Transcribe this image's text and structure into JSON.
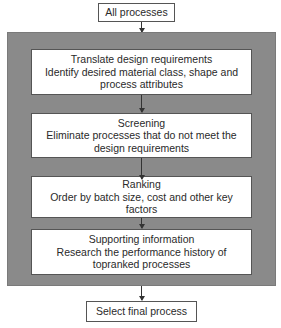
{
  "diagram": {
    "type": "flowchart",
    "start": {
      "label": "All processes"
    },
    "steps": [
      {
        "title": "Translate design requirements",
        "lines": [
          "Identify desired material class, shape and",
          "process attributes"
        ]
      },
      {
        "title": "Screening",
        "lines": [
          "Eliminate processes that do not meet the",
          "design requirements"
        ]
      },
      {
        "title": "Ranking",
        "lines": [
          "Order by batch size, cost and other key",
          "factors"
        ]
      },
      {
        "title": "Supporting information",
        "lines": [
          "Research the performance history of",
          "topranked processes"
        ]
      }
    ],
    "end": {
      "label": "Select final process"
    },
    "colors": {
      "shade_background": "#cfcfcf",
      "box_background": "#ffffff",
      "border": "#555555",
      "text": "#2a2a2a"
    }
  }
}
